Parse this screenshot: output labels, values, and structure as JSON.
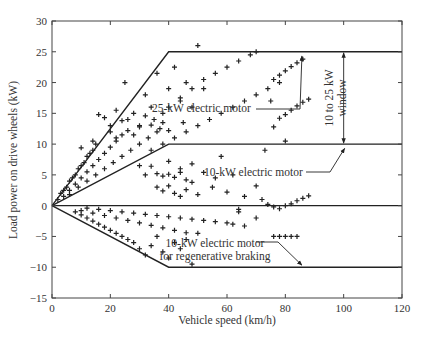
{
  "chart_data": {
    "type": "scatter",
    "title": "",
    "xlabel": "Vehicle speed (km/h)",
    "ylabel": "Load power on drive wheels (kW)",
    "xlim": [
      0,
      120
    ],
    "ylim": [
      -15,
      30
    ],
    "xticks": [
      0,
      20,
      40,
      60,
      80,
      100,
      120
    ],
    "yticks": [
      -15,
      -10,
      -5,
      0,
      5,
      10,
      15,
      20,
      25,
      30
    ],
    "grid": false,
    "legend": null,
    "marker": "+",
    "boundary_lines": [
      {
        "name": "25-kW electric motor",
        "points": [
          [
            0,
            0
          ],
          [
            40,
            25
          ],
          [
            120,
            25
          ]
        ]
      },
      {
        "name": "10-kW electric motor",
        "points": [
          [
            0,
            0
          ],
          [
            40,
            10
          ],
          [
            120,
            10
          ]
        ]
      },
      {
        "name": "zero line",
        "points": [
          [
            0,
            0
          ],
          [
            120,
            0
          ]
        ]
      },
      {
        "name": "10-kW electric motor for regenerative braking",
        "points": [
          [
            0,
            0
          ],
          [
            40,
            -10
          ],
          [
            120,
            -10
          ]
        ]
      }
    ],
    "annotations": [
      {
        "text": "25-kW electric motor",
        "x": 67,
        "y": 17.5,
        "arrow_to": [
          85,
          24.8
        ]
      },
      {
        "text": "10-kW electric motor",
        "x": 61,
        "y": 7.5,
        "arrow_to": [
          100,
          9.8
        ]
      },
      {
        "text": "10 to 25 kW window",
        "x": 103,
        "y": 17.5,
        "double_arrow": [
          [
            100,
            25
          ],
          [
            100,
            10
          ]
        ]
      },
      {
        "text": "10-kW electric motor for regenerative braking",
        "x": 67,
        "y": -7,
        "arrow_to": [
          85,
          -10
        ]
      }
    ],
    "series": [
      {
        "name": "driving cycle load points",
        "points": [
          [
            2,
            1
          ],
          [
            3,
            2
          ],
          [
            4,
            2.5
          ],
          [
            5,
            3
          ],
          [
            6,
            4
          ],
          [
            7,
            4.5
          ],
          [
            8,
            5
          ],
          [
            9,
            6
          ],
          [
            10,
            6.5
          ],
          [
            11,
            7
          ],
          [
            12,
            8
          ],
          [
            13,
            8.5
          ],
          [
            14,
            9
          ],
          [
            15,
            10
          ],
          [
            4,
            1.5
          ],
          [
            6,
            2.5
          ],
          [
            8,
            3.5
          ],
          [
            10,
            4.5
          ],
          [
            12,
            5.5
          ],
          [
            14,
            6.5
          ],
          [
            16,
            7.5
          ],
          [
            18,
            8.5
          ],
          [
            20,
            9.5
          ],
          [
            22,
            10.5
          ],
          [
            24,
            11.5
          ],
          [
            6,
            1.8
          ],
          [
            9,
            3
          ],
          [
            12,
            4
          ],
          [
            15,
            5
          ],
          [
            18,
            6
          ],
          [
            21,
            7
          ],
          [
            24,
            8
          ],
          [
            27,
            9
          ],
          [
            30,
            10
          ],
          [
            33,
            11
          ],
          [
            36,
            12
          ],
          [
            10,
            9.4
          ],
          [
            14,
            10.5
          ],
          [
            16,
            14.8
          ],
          [
            18,
            14.3
          ],
          [
            20,
            12
          ],
          [
            22,
            11
          ],
          [
            25,
            20
          ],
          [
            26,
            14
          ],
          [
            28,
            15
          ],
          [
            30,
            13
          ],
          [
            32,
            18
          ],
          [
            34,
            16
          ],
          [
            36,
            21.5
          ],
          [
            38,
            15
          ],
          [
            40,
            19
          ],
          [
            42,
            22.5
          ],
          [
            44,
            17
          ],
          [
            45,
            13.5
          ],
          [
            46,
            20
          ],
          [
            48,
            16
          ],
          [
            50,
            26
          ],
          [
            52,
            19
          ],
          [
            35,
            14
          ],
          [
            37,
            12.5
          ],
          [
            20,
            13
          ],
          [
            22,
            15.5
          ],
          [
            24,
            13.8
          ],
          [
            26,
            12.2
          ],
          [
            28,
            11.5
          ],
          [
            30,
            12.8
          ],
          [
            32,
            14.6
          ],
          [
            34,
            13.1
          ],
          [
            38,
            13.5
          ],
          [
            40,
            12.2
          ],
          [
            34,
            9
          ],
          [
            38,
            10
          ],
          [
            42,
            11
          ],
          [
            46,
            12
          ],
          [
            50,
            13
          ],
          [
            54,
            14
          ],
          [
            58,
            15
          ],
          [
            62,
            16
          ],
          [
            66,
            17
          ],
          [
            70,
            18
          ],
          [
            74,
            19
          ],
          [
            78,
            20
          ],
          [
            40,
            16
          ],
          [
            44,
            17.5
          ],
          [
            48,
            19
          ],
          [
            52,
            20.5
          ],
          [
            56,
            21.5
          ],
          [
            60,
            22.5
          ],
          [
            64,
            23.5
          ],
          [
            68,
            24.5
          ],
          [
            70,
            25
          ],
          [
            76,
            20.5
          ],
          [
            78,
            21.2
          ],
          [
            80,
            21.9
          ],
          [
            82,
            22.6
          ],
          [
            84,
            23.2
          ],
          [
            86,
            23.8
          ],
          [
            78,
            14.2
          ],
          [
            80,
            14.8
          ],
          [
            82,
            15.5
          ],
          [
            84,
            16.2
          ],
          [
            86,
            16.8
          ],
          [
            88,
            17.3
          ],
          [
            75,
            17
          ],
          [
            73,
            9
          ],
          [
            76,
            12.8
          ],
          [
            80,
            10.5
          ],
          [
            30,
            6.5
          ],
          [
            32,
            5
          ],
          [
            34,
            6.4
          ],
          [
            36,
            5.2
          ],
          [
            38,
            4.8
          ],
          [
            40,
            5.1
          ],
          [
            42,
            4.6
          ],
          [
            44,
            5.4
          ],
          [
            46,
            4.2
          ],
          [
            48,
            3.8
          ],
          [
            36,
            3
          ],
          [
            38,
            2.4
          ],
          [
            40,
            3.2
          ],
          [
            42,
            2
          ],
          [
            44,
            1.5
          ],
          [
            46,
            2.6
          ],
          [
            50,
            1.8
          ],
          [
            55,
            3
          ],
          [
            60,
            2.2
          ],
          [
            64,
            -1
          ],
          [
            40,
            7.2
          ],
          [
            44,
            6
          ],
          [
            48,
            6.8
          ],
          [
            52,
            5.4
          ],
          [
            58,
            8
          ],
          [
            56,
            4.5
          ],
          [
            62,
            5
          ],
          [
            66,
            1.5
          ],
          [
            70,
            3.2
          ],
          [
            72,
            1
          ],
          [
            78,
            -0.5
          ],
          [
            80,
            0
          ],
          [
            82,
            0.3
          ],
          [
            84,
            0.8
          ],
          [
            86,
            1.2
          ],
          [
            88,
            1.6
          ],
          [
            74,
            0.2
          ],
          [
            76,
            -0.2
          ],
          [
            8,
            -1
          ],
          [
            10,
            -1.5
          ],
          [
            12,
            -2
          ],
          [
            14,
            -2.5
          ],
          [
            16,
            -3
          ],
          [
            18,
            -3.5
          ],
          [
            20,
            -4
          ],
          [
            22,
            -4.5
          ],
          [
            24,
            -5
          ],
          [
            26,
            -5.5
          ],
          [
            28,
            -6
          ],
          [
            10,
            -0.8
          ],
          [
            14,
            -1.2
          ],
          [
            18,
            -1.6
          ],
          [
            22,
            -2
          ],
          [
            26,
            -2.4
          ],
          [
            30,
            -2.8
          ],
          [
            34,
            -3.2
          ],
          [
            38,
            -3.6
          ],
          [
            42,
            -4
          ],
          [
            46,
            -4.4
          ],
          [
            12,
            -0.4
          ],
          [
            16,
            -0.6
          ],
          [
            20,
            -0.8
          ],
          [
            24,
            -1
          ],
          [
            28,
            -1.2
          ],
          [
            32,
            -1.4
          ],
          [
            36,
            -1.6
          ],
          [
            40,
            -1.8
          ],
          [
            44,
            -2
          ],
          [
            48,
            -2.2
          ],
          [
            52,
            -2.4
          ],
          [
            56,
            -2.6
          ],
          [
            60,
            -2.8
          ],
          [
            30,
            -7
          ],
          [
            32,
            -8
          ],
          [
            34,
            -6.5
          ],
          [
            36,
            -5
          ],
          [
            38,
            -7.5
          ],
          [
            40,
            -8.5
          ],
          [
            42,
            -6
          ],
          [
            44,
            -7
          ],
          [
            46,
            -5.5
          ],
          [
            48,
            -9.5
          ],
          [
            50,
            -4.5
          ],
          [
            62,
            -3
          ],
          [
            66,
            -3.3
          ],
          [
            76,
            -5
          ],
          [
            78,
            -5
          ],
          [
            80,
            -5
          ],
          [
            82,
            -5
          ],
          [
            84,
            -5
          ],
          [
            70,
            -2
          ],
          [
            64,
            -0.6
          ]
        ]
      }
    ]
  }
}
